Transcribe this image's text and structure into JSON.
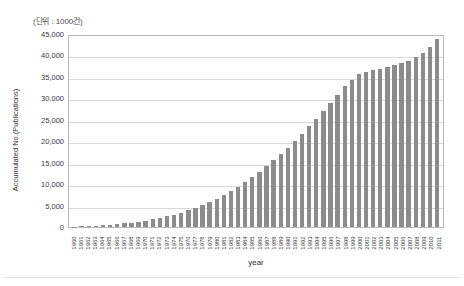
{
  "chart_data": {
    "type": "bar",
    "title": "",
    "unit_note": "(단위 : 1000건)",
    "xlabel": "year",
    "ylabel": "Accumulated No.(Publications)",
    "ylim": [
      0,
      45000
    ],
    "ytick_labels": [
      "45,000",
      "40,000",
      "35,000",
      "30,000",
      "25,000",
      "20,000",
      "15,000",
      "10,000",
      "5,000",
      "0"
    ],
    "ytick_values": [
      45000,
      40000,
      35000,
      30000,
      25000,
      20000,
      15000,
      10000,
      5000,
      0
    ],
    "grid": "horizontal",
    "legend": "none",
    "bar_color": "#8c8c8c",
    "categories": [
      "1960",
      "1961",
      "1962",
      "1963",
      "1964",
      "1965",
      "1966",
      "1967",
      "1968",
      "1969",
      "1970",
      "1971",
      "1972",
      "1973",
      "1974",
      "1975",
      "1976",
      "1977",
      "1978",
      "1979",
      "1980",
      "1981",
      "1982",
      "1983",
      "1984",
      "1985",
      "1986",
      "1987",
      "1988",
      "1989",
      "1990",
      "1991",
      "1992",
      "1993",
      "1994",
      "1995",
      "1996",
      "1997",
      "1998",
      "1999",
      "2000",
      "2001",
      "2002",
      "2003",
      "2004",
      "2005",
      "2006",
      "2007",
      "2008",
      "2009",
      "2010",
      "2011"
    ],
    "values": [
      120,
      180,
      250,
      330,
      430,
      540,
      680,
      840,
      1030,
      1250,
      1500,
      1790,
      2120,
      2500,
      2930,
      3400,
      3930,
      4520,
      5180,
      5900,
      6700,
      7560,
      8500,
      9500,
      10600,
      11750,
      13000,
      14300,
      15700,
      17150,
      18700,
      20300,
      21950,
      23700,
      25500,
      27350,
      29250,
      31200,
      33150,
      34600,
      36000,
      36500,
      36900,
      37300,
      37700,
      38100,
      38550,
      39150,
      40000,
      41100,
      42500,
      44400
    ]
  },
  "axes": {
    "y_title": "Accumulated No.(Publications)",
    "x_title": "year",
    "unit_label": "(단위 : 1000건)"
  }
}
